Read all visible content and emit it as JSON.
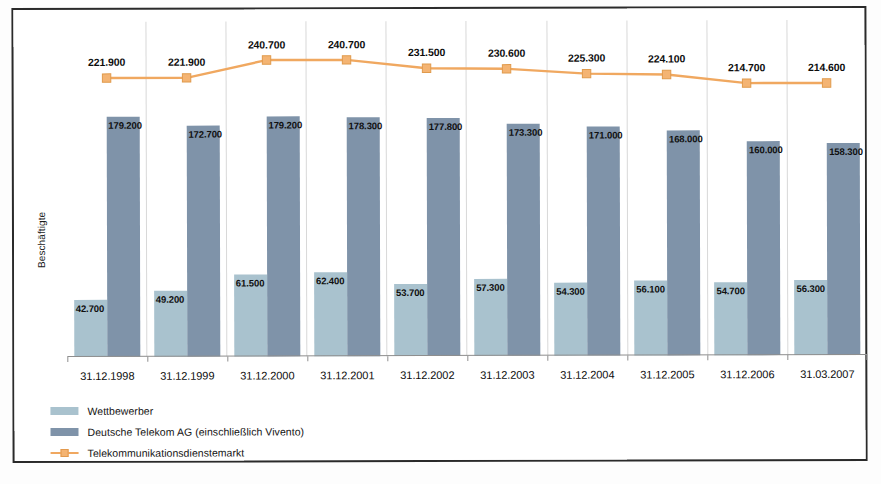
{
  "chart_data": {
    "type": "bar",
    "title": "",
    "xlabel": "",
    "ylabel": "Beschäftigte",
    "ylim": [
      0,
      250000
    ],
    "grid": false,
    "legend_position": "bottom-left",
    "categories": [
      "31.12.1998",
      "31.12.1999",
      "31.12.2000",
      "31.12.2001",
      "31.12.2002",
      "31.12.2003",
      "31.12.2004",
      "31.12.2005",
      "31.12.2006",
      "31.03.2007"
    ],
    "series": [
      {
        "name": "Wettbewerber",
        "type": "bar",
        "color": "#a9c2ce",
        "values": [
          42700,
          49200,
          61500,
          62400,
          53700,
          57300,
          54300,
          56100,
          54700,
          56300
        ],
        "labels": [
          "42.700",
          "49.200",
          "61.500",
          "62.400",
          "53.700",
          "57.300",
          "54.300",
          "56.100",
          "54.700",
          "56.300"
        ]
      },
      {
        "name": "Deutsche Telekom AG (einschließlich Vivento)",
        "type": "bar",
        "color": "#7f93a9",
        "values": [
          179200,
          172700,
          179200,
          178300,
          177800,
          173300,
          171000,
          168000,
          160000,
          158300
        ],
        "labels": [
          "179.200",
          "172.700",
          "179.200",
          "178.300",
          "177.800",
          "173.300",
          "171.000",
          "168.000",
          "160.000",
          "158.300"
        ]
      },
      {
        "name": "Telekommunikationsdienstemarkt",
        "type": "line",
        "color": "#f0a860",
        "marker": "square",
        "values": [
          221900,
          221900,
          240700,
          240700,
          231500,
          230600,
          225300,
          224100,
          214700,
          214600
        ],
        "labels": [
          "221.900",
          "221.900",
          "240.700",
          "240.700",
          "231.500",
          "230.600",
          "225.300",
          "224.100",
          "214.700",
          "214.600"
        ]
      }
    ]
  },
  "axis": {
    "y_title": "Beschäftigte"
  },
  "legend": {
    "items": [
      {
        "label": "Wettbewerber",
        "swatch": "light"
      },
      {
        "label": "Deutsche Telekom AG (einschließlich Vivento)",
        "swatch": "dark"
      },
      {
        "label": "Telekommunikationsdienstemarkt",
        "swatch": "line"
      }
    ]
  },
  "caption": {
    "text": ""
  }
}
